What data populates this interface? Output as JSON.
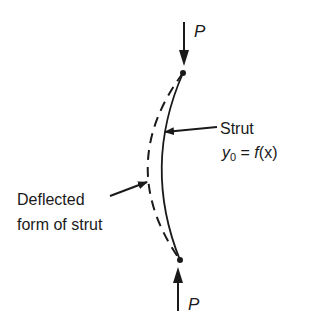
{
  "diagram": {
    "type": "strut-buckling-sketch",
    "colors": {
      "ink": "#1a1a1a",
      "background": "#ffffff"
    },
    "loads": {
      "top": {
        "label": "P",
        "direction": "down"
      },
      "bottom": {
        "label": "P",
        "direction": "up"
      }
    },
    "labels": {
      "strut": "Strut",
      "equation": {
        "y": "y",
        "sub": "0",
        "rest": " = ",
        "f": "f",
        "args": "(x)"
      },
      "deflected_line1": "Deflected",
      "deflected_line2": "form of strut"
    }
  }
}
